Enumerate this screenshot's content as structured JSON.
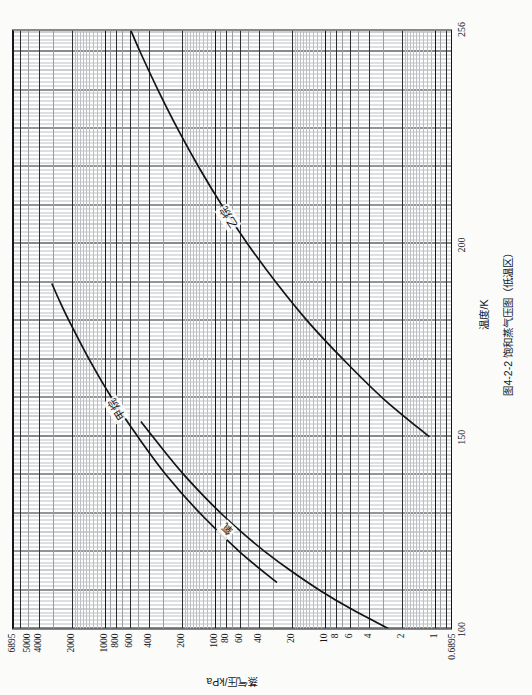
{
  "figure": {
    "caption": "图4-2-2  饱和蒸气压图（低温区）",
    "x_axis_title": "温度/K",
    "y_axis_title": "蒸气压/kPa"
  },
  "chart_data": {
    "type": "line",
    "title": "图4-2-2  饱和蒸气压图（低温区）",
    "xlabel": "温度/K",
    "ylabel": "蒸气压/kPa",
    "xscale": "linear",
    "yscale": "log",
    "xlim": [
      100,
      256
    ],
    "ylim": [
      0.6895,
      6895
    ],
    "grid": true,
    "legend": "inline-curve-labels",
    "xticks": [
      100,
      150,
      200,
      256
    ],
    "xticklabels": [
      "100",
      "150",
      "200",
      "256"
    ],
    "yticks": [
      0.6895,
      1,
      2,
      4,
      6,
      8,
      10,
      20,
      40,
      60,
      80,
      100,
      200,
      400,
      600,
      800,
      1000,
      2000,
      4000,
      5000,
      6895
    ],
    "yticklabels": [
      "0.6895",
      "1",
      "2",
      "4",
      "6",
      "8",
      "10",
      "20",
      "40",
      "60",
      "80",
      "100",
      "200",
      "400",
      "600",
      "800",
      "1000",
      "2000",
      "4000",
      "5000",
      "6895"
    ],
    "series": [
      {
        "name": "氧",
        "label": "氧",
        "x": [
          100,
          105,
          110,
          115,
          120,
          125,
          130,
          135,
          140,
          145,
          150,
          154
        ],
        "y": [
          2.6,
          5.6,
          11.0,
          20.0,
          34.5,
          56.0,
          87.0,
          130.0,
          189.0,
          265.0,
          365.0,
          470.0
        ]
      },
      {
        "name": "甲烷",
        "label": "甲烷",
        "x": [
          112,
          120,
          130,
          140,
          150,
          160,
          170,
          180,
          185,
          190
        ],
        "y": [
          27.0,
          59.0,
          135.0,
          275.0,
          500.0,
          860.0,
          1380.0,
          2100.0,
          2550.0,
          3050.0
        ]
      },
      {
        "name": "乙烷",
        "label": "乙烷",
        "x": [
          150,
          160,
          170,
          180,
          190,
          200,
          210,
          220,
          230,
          240,
          250,
          256
        ],
        "y": [
          1.1,
          2.9,
          6.6,
          14.0,
          27.0,
          49.0,
          84.0,
          137.0,
          214.0,
          322.0,
          470.0,
          580.0
        ]
      }
    ]
  }
}
